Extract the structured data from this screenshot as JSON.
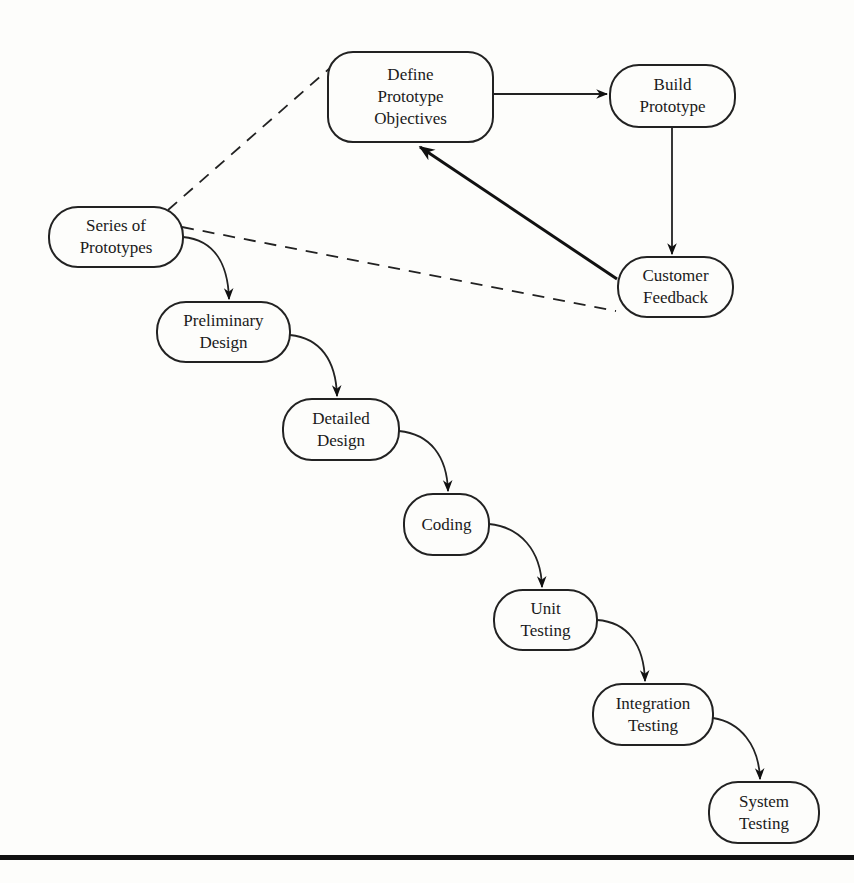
{
  "diagram": {
    "type": "process-flow",
    "nodes": [
      {
        "id": "define",
        "label": "Define\nPrototype\nObjectives"
      },
      {
        "id": "build",
        "label": "Build\nPrototype"
      },
      {
        "id": "feedback",
        "label": "Customer\nFeedback"
      },
      {
        "id": "series",
        "label": "Series of\nPrototypes"
      },
      {
        "id": "prelim",
        "label": "Preliminary\nDesign"
      },
      {
        "id": "detailed",
        "label": "Detailed\nDesign"
      },
      {
        "id": "coding",
        "label": "Coding"
      },
      {
        "id": "unit",
        "label": "Unit\nTesting"
      },
      {
        "id": "integration",
        "label": "Integration\nTesting"
      },
      {
        "id": "system",
        "label": "System\nTesting"
      }
    ],
    "edges": [
      {
        "from": "define",
        "to": "build",
        "style": "solid-arrow"
      },
      {
        "from": "build",
        "to": "feedback",
        "style": "solid-arrow"
      },
      {
        "from": "feedback",
        "to": "define",
        "style": "bold-arrow"
      },
      {
        "from": "series",
        "to": "define",
        "style": "dashed"
      },
      {
        "from": "series",
        "to": "feedback",
        "style": "dashed"
      },
      {
        "from": "series",
        "to": "prelim",
        "style": "curved-arrow"
      },
      {
        "from": "prelim",
        "to": "detailed",
        "style": "curved-arrow"
      },
      {
        "from": "detailed",
        "to": "coding",
        "style": "curved-arrow"
      },
      {
        "from": "coding",
        "to": "unit",
        "style": "curved-arrow"
      },
      {
        "from": "unit",
        "to": "integration",
        "style": "curved-arrow"
      },
      {
        "from": "integration",
        "to": "system",
        "style": "curved-arrow"
      }
    ]
  }
}
